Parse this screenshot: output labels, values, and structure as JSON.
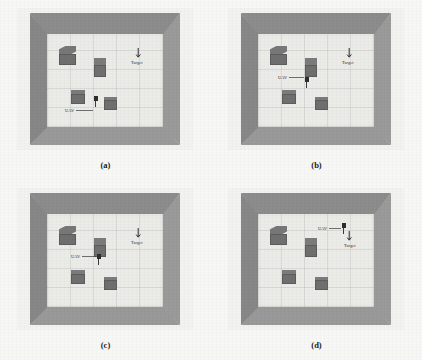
{
  "figure": {
    "background_color": "#f7f7f5",
    "wall_color": "#8e8e8e",
    "floor_color": "#ebebe8",
    "obstacle_color": "#6f6f6f",
    "marker_color": "#2e2e2e"
  },
  "labels": {
    "uav": "UAV",
    "target": "Target"
  },
  "panels": [
    {
      "caption": "(a)",
      "uav_label": "UAV",
      "target_label": "Target",
      "uav": {
        "x": 47,
        "y": 62
      },
      "uav_label_pos": {
        "x": 18,
        "y": 74
      },
      "target": {
        "x": 88,
        "y": 14
      },
      "target_label_pos": {
        "x": 84,
        "y": 26
      },
      "obstacles": [
        {
          "x": 12,
          "y": 12,
          "w": 17,
          "h": 19,
          "top": 9,
          "kind": "big"
        },
        {
          "x": 47,
          "y": 24,
          "w": 12,
          "h": 19,
          "top": 8,
          "kind": "tall"
        },
        {
          "x": 24,
          "y": 56,
          "w": 14,
          "h": 14,
          "top": 5,
          "kind": "flat"
        },
        {
          "x": 57,
          "y": 63,
          "w": 13,
          "h": 13,
          "top": 4,
          "kind": "flat"
        }
      ]
    },
    {
      "caption": "(b)",
      "uav_label": "UAV",
      "target_label": "Target",
      "uav": {
        "x": 47,
        "y": 43
      },
      "uav_label_pos": {
        "x": 20,
        "y": 41
      },
      "target": {
        "x": 88,
        "y": 14
      },
      "target_label_pos": {
        "x": 84,
        "y": 26
      },
      "obstacles": [
        {
          "x": 12,
          "y": 12,
          "w": 17,
          "h": 19,
          "top": 9,
          "kind": "big"
        },
        {
          "x": 47,
          "y": 24,
          "w": 12,
          "h": 19,
          "top": 8,
          "kind": "tall"
        },
        {
          "x": 24,
          "y": 56,
          "w": 14,
          "h": 14,
          "top": 5,
          "kind": "flat"
        },
        {
          "x": 57,
          "y": 63,
          "w": 13,
          "h": 13,
          "top": 4,
          "kind": "flat"
        }
      ]
    },
    {
      "caption": "(c)",
      "uav_label": "UAV",
      "target_label": "Target",
      "uav": {
        "x": 50,
        "y": 40
      },
      "uav_label_pos": {
        "x": 24,
        "y": 40
      },
      "target": {
        "x": 88,
        "y": 14
      },
      "target_label_pos": {
        "x": 84,
        "y": 26
      },
      "obstacles": [
        {
          "x": 12,
          "y": 12,
          "w": 17,
          "h": 19,
          "top": 9,
          "kind": "big"
        },
        {
          "x": 47,
          "y": 24,
          "w": 12,
          "h": 19,
          "top": 8,
          "kind": "tall"
        },
        {
          "x": 24,
          "y": 56,
          "w": 14,
          "h": 14,
          "top": 5,
          "kind": "flat"
        },
        {
          "x": 57,
          "y": 63,
          "w": 13,
          "h": 13,
          "top": 4,
          "kind": "flat"
        }
      ]
    },
    {
      "caption": "(d)",
      "uav_label": "UAV",
      "target_label": "Target",
      "uav": {
        "x": 84,
        "y": 9
      },
      "uav_label_pos": {
        "x": 60,
        "y": 12
      },
      "target": {
        "x": 88,
        "y": 17
      },
      "target_label_pos": {
        "x": 86,
        "y": 29
      },
      "obstacles": [
        {
          "x": 12,
          "y": 12,
          "w": 17,
          "h": 19,
          "top": 9,
          "kind": "big"
        },
        {
          "x": 47,
          "y": 24,
          "w": 12,
          "h": 19,
          "top": 8,
          "kind": "tall"
        },
        {
          "x": 24,
          "y": 56,
          "w": 14,
          "h": 14,
          "top": 5,
          "kind": "flat"
        },
        {
          "x": 57,
          "y": 63,
          "w": 13,
          "h": 13,
          "top": 4,
          "kind": "flat"
        }
      ]
    }
  ]
}
